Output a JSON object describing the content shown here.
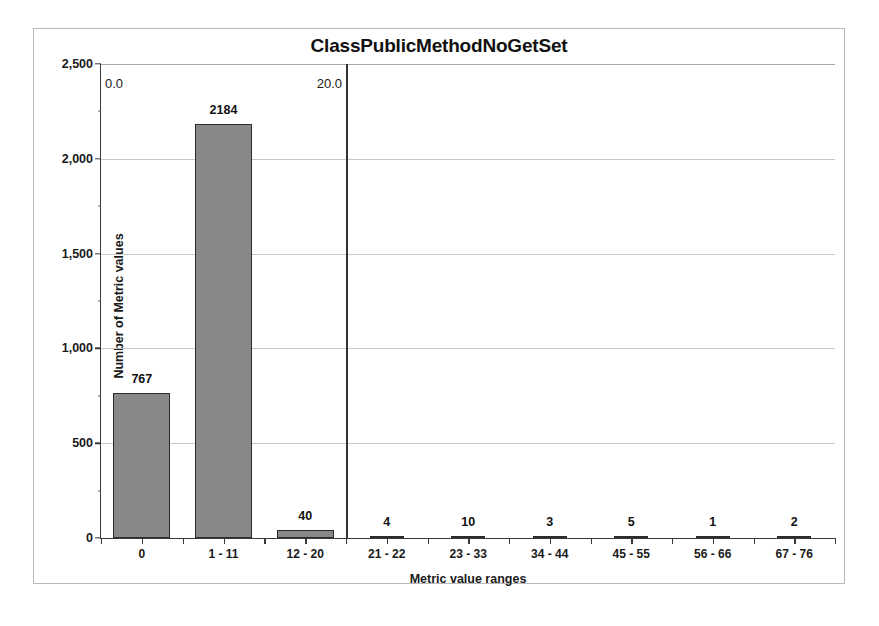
{
  "chart_data": {
    "type": "bar",
    "title": "ClassPublicMethodNoGetSet",
    "xlabel": "Metric value ranges",
    "ylabel": "Number of Metric values",
    "categories": [
      "0",
      "1 - 11",
      "12 - 20",
      "21 - 22",
      "23 - 33",
      "34 - 44",
      "45 - 55",
      "56 - 66",
      "67 - 76"
    ],
    "values": [
      767,
      2184,
      40,
      4,
      10,
      3,
      5,
      1,
      2
    ],
    "ylim": [
      0,
      2500
    ],
    "yticks": [
      0,
      500,
      1000,
      1500,
      2000,
      2500
    ],
    "ytick_labels": [
      "0",
      "500",
      "1,000",
      "1,500",
      "2,000",
      "2,500"
    ],
    "grid": true,
    "legend": false,
    "bar_color": "#888888",
    "bar_edge_color": "#2b2b2b",
    "gridline_color": "#c8c8c8",
    "annotations": {
      "threshold_line_label_min": "0.0",
      "threshold_line_label_max": "20.0"
    }
  }
}
